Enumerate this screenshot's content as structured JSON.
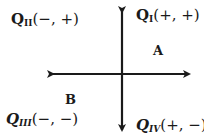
{
  "diagram": {
    "type": "cartesian-quadrants",
    "axis_color": "#1a1a1a",
    "axes": {
      "origin": [
        122,
        74
      ],
      "x_axis": {
        "from": 47,
        "to": 195,
        "arrows": "both"
      },
      "y_axis": {
        "from": 6,
        "to": 136,
        "arrows": "both"
      }
    },
    "quadrants": [
      {
        "id": "QI",
        "letter": "Q",
        "subscript": "I",
        "signs": "(+, +)",
        "italic": false
      },
      {
        "id": "QII",
        "letter": "Q",
        "subscript": "II",
        "signs": "(−, +)",
        "italic": false
      },
      {
        "id": "QIII",
        "letter": "Q",
        "subscript": "III",
        "signs": "(−, −)",
        "italic": true
      },
      {
        "id": "QIV",
        "letter": "Q",
        "subscript": "IV",
        "signs": "(+, −)",
        "italic": true
      }
    ],
    "regions": [
      {
        "id": "A",
        "label": "A"
      },
      {
        "id": "B",
        "label": "B"
      }
    ]
  }
}
